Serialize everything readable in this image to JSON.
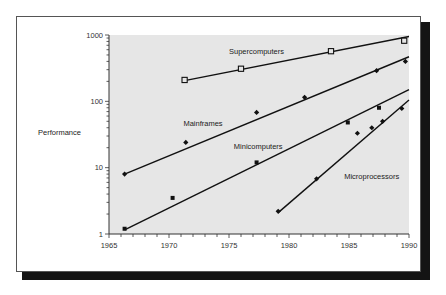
{
  "chart_data": {
    "type": "line",
    "title": "",
    "xlabel": "",
    "ylabel": "Performance",
    "xlim": [
      1965,
      1990
    ],
    "ylim": [
      1,
      1000
    ],
    "yscale": "log",
    "grid": false,
    "legend": "inline labels",
    "x_ticks": [
      "1965",
      "1970",
      "1975",
      "1980",
      "1985",
      "1990"
    ],
    "y_ticks": [
      "1",
      "10",
      "100",
      "1000"
    ],
    "series": [
      {
        "name": "Supercomputers",
        "marker": "open-square",
        "points": [
          [
            1971.3,
            210
          ],
          [
            1976.0,
            310
          ],
          [
            1983.5,
            570
          ],
          [
            1989.6,
            820
          ]
        ],
        "trend": [
          [
            1971.3,
            205
          ],
          [
            1990.0,
            950
          ]
        ],
        "label_pos": [
          1975.0,
          520
        ]
      },
      {
        "name": "Mainframes",
        "marker": "diamond",
        "points": [
          [
            1966.3,
            8
          ],
          [
            1971.4,
            24
          ],
          [
            1977.3,
            68
          ],
          [
            1981.3,
            115
          ],
          [
            1987.3,
            290
          ],
          [
            1989.7,
            400
          ]
        ],
        "trend": [
          [
            1966.3,
            8
          ],
          [
            1990.0,
            470
          ]
        ],
        "label_pos": [
          1971.2,
          42
        ]
      },
      {
        "name": "Minicomputers",
        "marker": "filled-square",
        "points": [
          [
            1966.3,
            1.2
          ],
          [
            1970.3,
            3.5
          ],
          [
            1977.3,
            12
          ],
          [
            1984.9,
            48
          ],
          [
            1987.5,
            80
          ]
        ],
        "trend": [
          [
            1966.3,
            1.15
          ],
          [
            1990.0,
            150
          ]
        ],
        "label_pos": [
          1975.4,
          19
        ]
      },
      {
        "name": "Microprocessors",
        "marker": "diamond",
        "points": [
          [
            1979.1,
            2.2
          ],
          [
            1982.3,
            6.8
          ],
          [
            1985.7,
            33
          ],
          [
            1986.9,
            40
          ],
          [
            1987.8,
            50
          ],
          [
            1989.4,
            78
          ]
        ],
        "trend": [
          [
            1979.1,
            2.1
          ],
          [
            1990.0,
            105
          ]
        ],
        "label_pos": [
          1984.6,
          6.8
        ]
      }
    ]
  },
  "colors": {
    "plot_bg": "#e6e6e6",
    "line": "#111111",
    "frame_shadow": "#141414"
  }
}
